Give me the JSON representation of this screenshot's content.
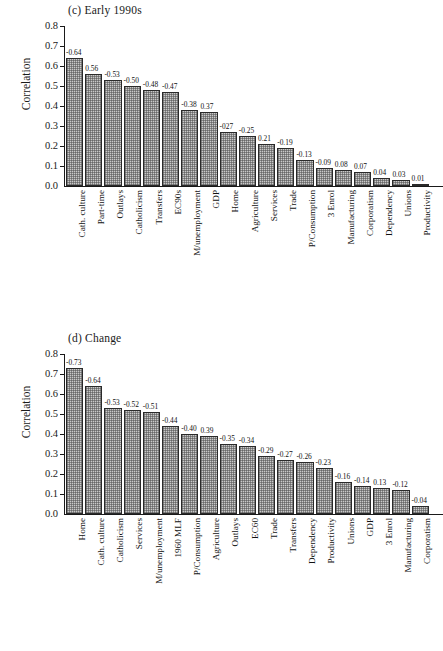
{
  "figure": {
    "panels": [
      {
        "id": "c",
        "title": "(c) Early 1990s",
        "ylabel": "Correlation"
      },
      {
        "id": "d",
        "title": "(d) Change",
        "ylabel": "Correlation"
      }
    ]
  },
  "axis": {
    "y_ticks": [
      "0.0",
      "0.1",
      "0.2",
      "0.3",
      "0.4",
      "0.5",
      "0.6",
      "0.7",
      "0.8"
    ]
  },
  "chart_data": [
    {
      "type": "bar",
      "title": "(c) Early 1990s",
      "xlabel": "",
      "ylabel": "Correlation",
      "ylim": [
        0.0,
        0.8
      ],
      "grid": false,
      "legend": "none",
      "categories": [
        "Cath. culture",
        "Part-time",
        "Outlays",
        "Catholicism",
        "Transfers",
        "EC90s",
        "M/unemployment",
        "GDP",
        "Home",
        "Agriculture",
        "Services",
        "Trade",
        "P/Consumption",
        "3 Enrol",
        "Manufacturing",
        "Corporatism",
        "Dependency",
        "Unions",
        "Productivity"
      ],
      "values": [
        0.64,
        0.56,
        0.53,
        0.5,
        0.48,
        0.47,
        0.38,
        0.37,
        0.27,
        0.25,
        0.21,
        0.19,
        0.13,
        0.09,
        0.08,
        0.07,
        0.04,
        0.03,
        0.01
      ],
      "data_labels": [
        "-0.64",
        "0.56",
        "-0.53",
        "-0.50",
        "-0.48",
        "-0.47",
        "-0.38",
        "0.37",
        "-027",
        "-0.25",
        "0.21",
        "-0.19",
        "-0.13",
        "-0.09",
        "0.08",
        "0.07",
        "0.04",
        "0.03",
        "0.01"
      ]
    },
    {
      "type": "bar",
      "title": "(d) Change",
      "xlabel": "",
      "ylabel": "Correlation",
      "ylim": [
        0.0,
        0.8
      ],
      "grid": false,
      "legend": "none",
      "categories": [
        "Home",
        "Cath. culture",
        "Catholicism",
        "Services",
        "M/unemployment",
        "1960 MLF",
        "P/Consumption",
        "Agriculture",
        "Outlays",
        "EC60",
        "Trade",
        "Transfers",
        "Dependency",
        "Productivity",
        "Unions",
        "GDP",
        "3 Enrol",
        "Manufacturing",
        "Corporatism"
      ],
      "values": [
        0.73,
        0.64,
        0.53,
        0.52,
        0.51,
        0.44,
        0.4,
        0.39,
        0.35,
        0.34,
        0.29,
        0.27,
        0.26,
        0.23,
        0.16,
        0.14,
        0.13,
        0.12,
        0.04
      ],
      "data_labels": [
        "-0.73",
        "-0.64",
        "-0.53",
        "-0.52",
        "-0.51",
        "-0.44",
        "-0.40",
        "0.39",
        "-0.35",
        "-0.34",
        "-0.29",
        "-0.27",
        "-0.26",
        "-0.23",
        "-0.16",
        "-0.14",
        "0.13",
        "-0.12",
        "-0.04"
      ]
    }
  ]
}
